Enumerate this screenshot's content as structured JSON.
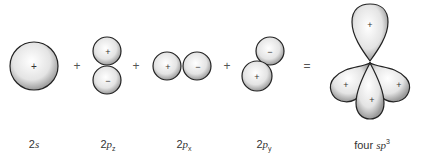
{
  "diagram": {
    "orbitals": [
      {
        "id": "2s",
        "label_prefix": "2",
        "label_italic": "s",
        "label_sub": "",
        "signs": [
          "+"
        ]
      },
      {
        "id": "2pz",
        "label_prefix": "2",
        "label_italic": "p",
        "label_sub": "z",
        "signs": [
          "+",
          "−"
        ]
      },
      {
        "id": "2px",
        "label_prefix": "2",
        "label_italic": "p",
        "label_sub": "x",
        "signs": [
          "+",
          "−"
        ]
      },
      {
        "id": "2py",
        "label_prefix": "2",
        "label_italic": "p",
        "label_sub": "y",
        "signs": [
          "−",
          "+"
        ]
      },
      {
        "id": "sp3",
        "label_prefix": "four ",
        "label_italic": "sp",
        "label_sup": "3",
        "signs": [
          "+",
          "+",
          "+",
          "+"
        ]
      }
    ],
    "operators": [
      "+",
      "+",
      "+",
      "="
    ]
  }
}
